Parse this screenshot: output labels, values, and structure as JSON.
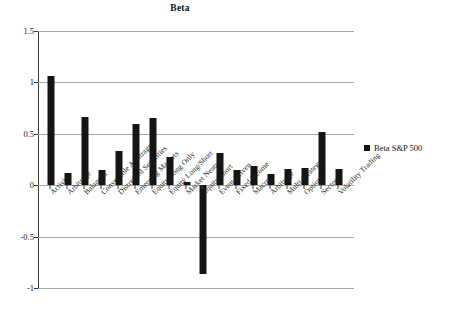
{
  "chart": {
    "title": "Beta",
    "legend": {
      "position": "right",
      "entries": [
        {
          "label": "Beta S&P 500",
          "color": "#141414",
          "marker": "square"
        }
      ]
    }
  },
  "chart_data": {
    "type": "bar",
    "title": "Beta",
    "xlabel": "",
    "ylabel": "",
    "ylim": [
      -1,
      1.5
    ],
    "yticks": [
      "1.5",
      "1",
      "0.5",
      "0",
      "-0.5",
      "-1"
    ],
    "ytick_values": [
      1.5,
      1,
      0.5,
      0,
      -0.5,
      -1
    ],
    "grid": true,
    "legend_position": "right",
    "categories": [
      "Activist",
      "Arbitrage",
      "Balanced",
      "Convertible Arbitrage",
      "Distressed Securities",
      "Emerging Markets",
      "Equity Long Only",
      "Equity Long/Short",
      "Market Neutral",
      "Equity Short",
      "Event Driven",
      "Fixed Income",
      "Macro",
      "Arbitrage",
      "Multi-Strategy",
      "Options",
      "Sector",
      "Volatility Trading"
    ],
    "series": [
      {
        "name": "Beta S&P 500",
        "color": "#141414",
        "values": [
          1.06,
          0.12,
          0.66,
          0.15,
          0.33,
          0.6,
          0.65,
          0.27,
          0.03,
          -0.86,
          0.31,
          0.15,
          0.19,
          0.11,
          0.16,
          0.17,
          0.52,
          0.16
        ]
      }
    ]
  }
}
